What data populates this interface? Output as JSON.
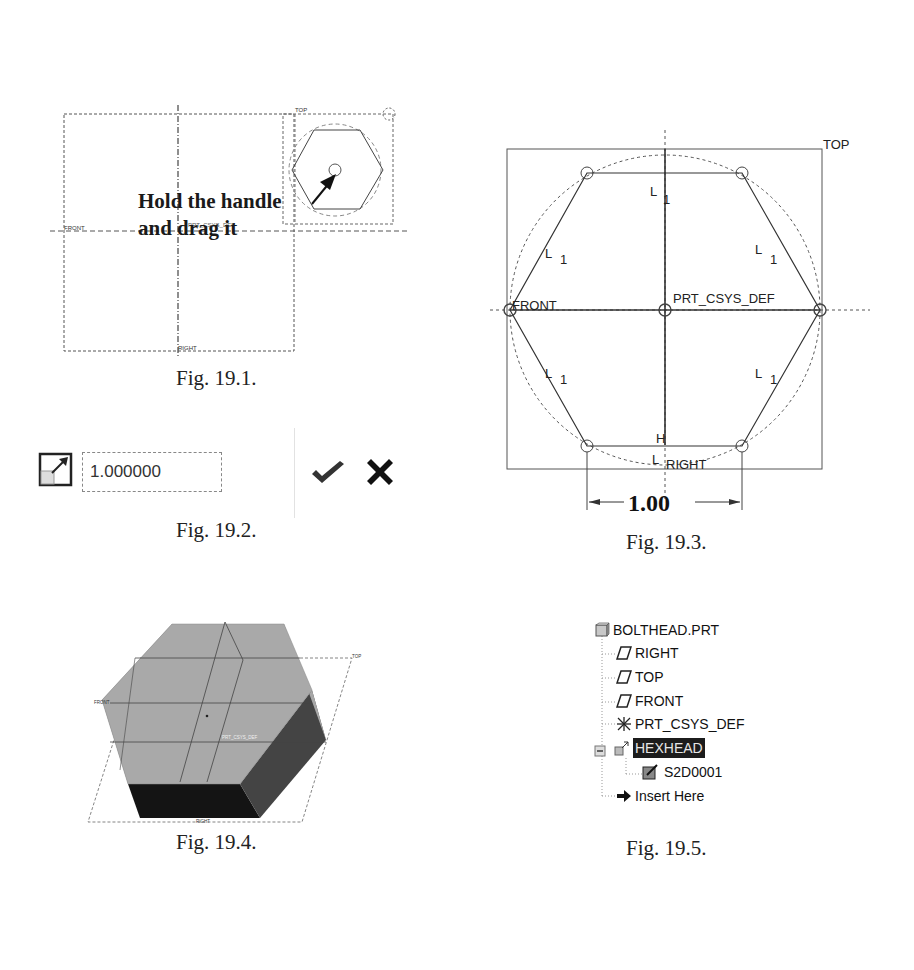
{
  "figures": {
    "fig1": {
      "caption": "Fig. 19.1.",
      "callout_line1": "Hold the handle",
      "callout_line2": "and drag it",
      "labels": {
        "top": "TOP",
        "front": "FRONT",
        "right": "RIGHT",
        "csys": "PRT_CSYS_DEF"
      }
    },
    "fig2": {
      "caption": "Fig. 19.2.",
      "scale_value": "1.000000",
      "icons": [
        "scale-icon",
        "check-icon",
        "close-icon"
      ]
    },
    "fig3": {
      "caption": "Fig. 19.3.",
      "labels": {
        "top": "TOP",
        "front": "FRONT",
        "right": "RIGHT",
        "csys": "PRT_CSYS_DEF"
      },
      "constraint_L": "L",
      "constraint_sub": "1",
      "constraint_H": "H",
      "dimension": "1.00"
    },
    "fig4": {
      "caption": "Fig. 19.4.",
      "labels": {
        "top": "TOP",
        "front": "FRONT",
        "right": "RIGHT",
        "csys": "PRT_CSYS_DEF"
      }
    },
    "fig5": {
      "caption": "Fig. 19.5.",
      "tree": [
        {
          "label": "BOLTHEAD.PRT",
          "icon": "part-icon"
        },
        {
          "label": "RIGHT",
          "icon": "datum-plane-icon"
        },
        {
          "label": "TOP",
          "icon": "datum-plane-icon"
        },
        {
          "label": "FRONT",
          "icon": "datum-plane-icon"
        },
        {
          "label": "PRT_CSYS_DEF",
          "icon": "csys-icon"
        },
        {
          "label": "HEXHEAD",
          "icon": "extrude-icon",
          "selected": true
        },
        {
          "label": "S2D0001",
          "icon": "sketch-icon"
        },
        {
          "label": "Insert Here",
          "icon": "arrow-right-icon"
        }
      ]
    }
  }
}
